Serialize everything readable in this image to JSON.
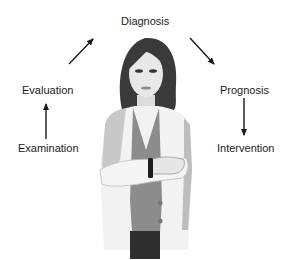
{
  "diagram": {
    "type": "cycle",
    "nodes": [
      {
        "id": "examination",
        "label": "Examination"
      },
      {
        "id": "evaluation",
        "label": "Evaluation"
      },
      {
        "id": "diagnosis",
        "label": "Diagnosis"
      },
      {
        "id": "prognosis",
        "label": "Prognosis"
      },
      {
        "id": "intervention",
        "label": "Intervention"
      }
    ],
    "edges": [
      {
        "from": "examination",
        "to": "evaluation"
      },
      {
        "from": "evaluation",
        "to": "diagnosis"
      },
      {
        "from": "diagnosis",
        "to": "prognosis"
      },
      {
        "from": "prognosis",
        "to": "intervention"
      }
    ],
    "center_illustration": "clinician-figure"
  },
  "colors": {
    "arrow": "#1a1a1a",
    "hair": "#3a3a3a",
    "skin": "#e6e6e6",
    "coat": "#f2f2f2",
    "coat_shadow": "#b8b8b8",
    "shirt": "#8c8c8c",
    "pants": "#2e2e2e"
  }
}
